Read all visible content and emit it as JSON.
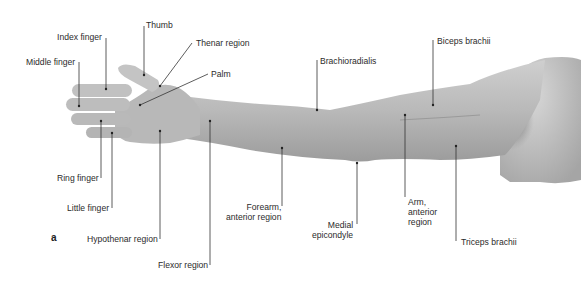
{
  "figure": {
    "panel_letter": "a",
    "colors": {
      "skin_light": "#c9c9c9",
      "skin_mid": "#ababab",
      "skin_dark": "#7e7e7e",
      "leader": "#333333",
      "text": "#2b2b2b"
    },
    "labels": [
      {
        "id": "thumb",
        "text": "Thumb",
        "x": 146,
        "y": 20,
        "align": "left"
      },
      {
        "id": "index_finger",
        "text": "Index finger",
        "x": 57,
        "y": 32,
        "align": "left"
      },
      {
        "id": "thenar_region",
        "text": "Thenar region",
        "x": 196,
        "y": 38,
        "align": "left"
      },
      {
        "id": "middle_finger",
        "text": "Middle finger",
        "x": 26,
        "y": 57,
        "align": "left"
      },
      {
        "id": "palm",
        "text": "Palm",
        "x": 211,
        "y": 69,
        "align": "left"
      },
      {
        "id": "brachioradialis",
        "text": "Brachioradialis",
        "x": 320,
        "y": 56,
        "align": "left"
      },
      {
        "id": "biceps_brachii",
        "text": "Biceps brachii",
        "x": 437,
        "y": 36,
        "align": "left"
      },
      {
        "id": "ring_finger",
        "text": "Ring finger",
        "x": 57,
        "y": 173,
        "align": "left"
      },
      {
        "id": "little_finger",
        "text": "Little finger",
        "x": 67,
        "y": 203,
        "align": "left"
      },
      {
        "id": "hypothenar_region",
        "text": "Hypothenar region",
        "x": 87,
        "y": 234,
        "align": "left"
      },
      {
        "id": "flexor_region",
        "text": "Flexor region",
        "x": 158,
        "y": 260,
        "align": "left"
      },
      {
        "id": "forearm_anterior",
        "text": "Forearm,\nanterior region",
        "x": 226,
        "y": 202,
        "align": "right",
        "lines": [
          "Forearm,",
          "anterior region"
        ]
      },
      {
        "id": "medial_epicondyle",
        "text": "Medial\nepicondyle",
        "x": 312,
        "y": 220,
        "align": "right",
        "lines": [
          "Medial",
          "epicondyle"
        ]
      },
      {
        "id": "arm_anterior",
        "text": "Arm,\nanterior\nregion",
        "x": 408,
        "y": 197,
        "align": "left",
        "lines": [
          "Arm,",
          "anterior",
          "region"
        ]
      },
      {
        "id": "triceps_brachii",
        "text": "Triceps brachii",
        "x": 461,
        "y": 237,
        "align": "left"
      }
    ]
  }
}
